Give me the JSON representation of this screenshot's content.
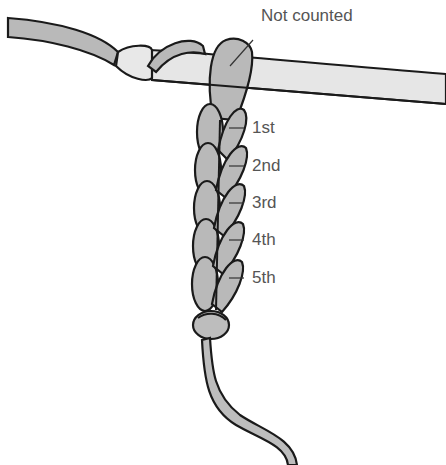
{
  "diagram": {
    "callout_top": "Not counted",
    "stitch_labels": [
      "1st",
      "2nd",
      "3rd",
      "4th",
      "5th"
    ],
    "colors": {
      "yarn": "#b9b9b9",
      "hook": "#e6e6e6",
      "outline": "#1a1a1a",
      "label_text": "#555555"
    }
  }
}
